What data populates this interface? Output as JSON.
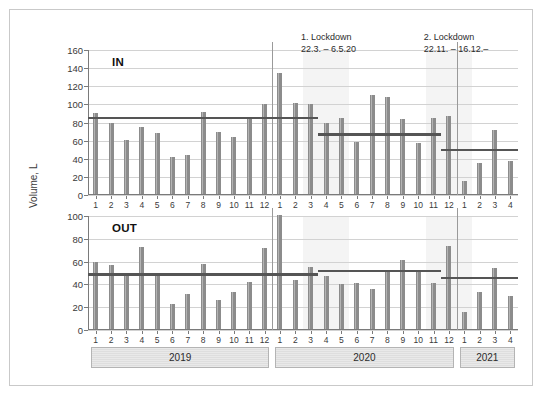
{
  "chart_data": {
    "type": "bar",
    "title": "",
    "ylabel": "Volume, L",
    "xlabel": "",
    "grid": true,
    "legend": "none",
    "panels": [
      {
        "name": "IN",
        "label": "IN",
        "ylim": [
          0,
          160
        ],
        "yticks": [
          0,
          20,
          40,
          60,
          80,
          100,
          120,
          140,
          160
        ],
        "values": [
          91,
          80,
          61,
          75,
          68,
          42,
          44,
          92,
          70,
          64,
          86,
          100,
          135,
          102,
          100,
          80,
          85,
          58,
          110,
          108,
          84,
          57,
          85,
          87,
          15,
          35,
          72,
          38
        ],
        "averages": [
          {
            "label": "avg 2019 / pre-lockdown",
            "value": 85,
            "from_index": 0,
            "to_index": 14
          },
          {
            "label": "avg lockdown period",
            "value": 67,
            "from_index": 15,
            "to_index": 22
          },
          {
            "label": "avg 2. lockdown / 2021",
            "value": 50,
            "from_index": 23,
            "to_index": 27
          }
        ]
      },
      {
        "name": "OUT",
        "label": "OUT",
        "ylim": [
          0,
          100
        ],
        "yticks": [
          0,
          20,
          40,
          60,
          80,
          100
        ],
        "values": [
          60,
          57,
          49,
          73,
          49,
          23,
          32,
          58,
          26,
          33,
          42,
          72,
          101,
          44,
          55,
          47,
          40,
          41,
          36,
          53,
          61,
          52,
          41,
          74,
          16,
          33,
          54,
          30
        ],
        "averages": [
          {
            "label": "avg 2019 / pre-lockdown",
            "value": 49,
            "from_index": 0,
            "to_index": 14
          },
          {
            "label": "avg lockdown period",
            "value": 52,
            "from_index": 15,
            "to_index": 22
          },
          {
            "label": "avg 2. lockdown / 2021",
            "value": 46,
            "from_index": 23,
            "to_index": 27
          }
        ]
      }
    ],
    "x": [
      "1",
      "2",
      "3",
      "4",
      "5",
      "6",
      "7",
      "8",
      "9",
      "10",
      "11",
      "12",
      "1",
      "2",
      "3",
      "4",
      "5",
      "6",
      "7",
      "8",
      "9",
      "10",
      "11",
      "12",
      "1",
      "2",
      "3",
      "4"
    ],
    "year_bands": [
      {
        "label": "2019",
        "from_index": 0,
        "to_index": 11
      },
      {
        "label": "2020",
        "from_index": 12,
        "to_index": 23
      },
      {
        "label": "2021",
        "from_index": 24,
        "to_index": 27
      }
    ],
    "year_separators": [
      12,
      24
    ],
    "annotations": [
      {
        "name": "lockdown-1",
        "line1": "1. Lockdown",
        "line2": "22.3. – 6.5.20",
        "from_index": 14,
        "to_index": 16
      },
      {
        "name": "lockdown-2",
        "line1": "2. Lockdown",
        "line2": "22.11. – 16.12.–",
        "from_index": 22,
        "to_index": 24
      }
    ],
    "colors": {
      "bar": "#8c8c8c",
      "average_line": "#555555",
      "grid": "#d2d2d2",
      "axis": "#7a7a7a",
      "shade_band": "#f4f4f4",
      "frame": "#c9c9c9",
      "text": "#262626"
    }
  }
}
